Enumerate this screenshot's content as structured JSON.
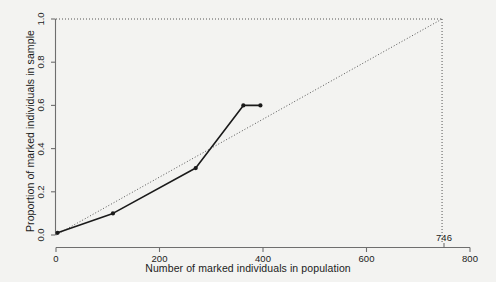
{
  "chart_data": {
    "type": "line",
    "title": "",
    "xlabel": "Number of marked individuals in population",
    "ylabel": "Proportion of marked individuals in sample",
    "xlim": [
      0,
      800
    ],
    "ylim": [
      0.0,
      1.0
    ],
    "grid": false,
    "legend": null,
    "xticks": [
      {
        "value": 0,
        "label": "0"
      },
      {
        "value": 200,
        "label": "200"
      },
      {
        "value": 400,
        "label": "400"
      },
      {
        "value": 600,
        "label": "600"
      },
      {
        "value": 800,
        "label": "800"
      }
    ],
    "yticks": [
      {
        "value": 0.0,
        "label": "0.0"
      },
      {
        "value": 0.2,
        "label": "0.2"
      },
      {
        "value": 0.4,
        "label": "0.4"
      },
      {
        "value": 0.6,
        "label": "0.6"
      },
      {
        "value": 0.8,
        "label": "0.8"
      },
      {
        "value": 1.0,
        "label": "1.0"
      }
    ],
    "series": [
      {
        "name": "observed",
        "style": "solid-with-markers",
        "color": "#1a1a1a",
        "marker": "filled-circle",
        "x": [
          3,
          110,
          270,
          362,
          395
        ],
        "y": [
          0.01,
          0.1,
          0.31,
          0.6,
          0.6
        ]
      },
      {
        "name": "reference-diagonal",
        "style": "dotted",
        "color": "#555555",
        "marker": "none",
        "x": [
          0,
          746
        ],
        "y": [
          0.0,
          1.0
        ]
      }
    ],
    "annotations": [
      {
        "name": "estimate-746",
        "label": "746",
        "x": 746,
        "y": 0.0,
        "guide_vertical": {
          "x": 746,
          "y_from": 0.0,
          "y_to": 1.0,
          "style": "dotted"
        },
        "guide_horizontal": {
          "y": 1.0,
          "x_from": 0,
          "x_to": 746,
          "style": "dotted"
        }
      }
    ]
  },
  "colors": {
    "background": "#f3f3f1",
    "axis": "#6e6e6e",
    "data_line": "#1a1a1a",
    "guide_line": "#555555",
    "text": "#1b1b1b"
  }
}
